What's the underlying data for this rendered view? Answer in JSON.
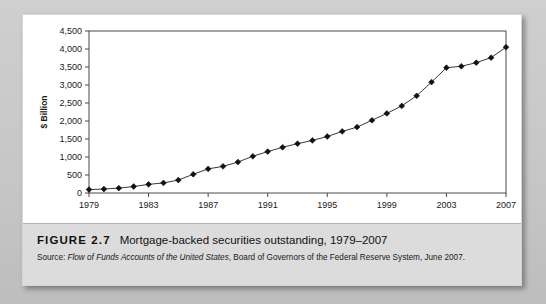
{
  "figure": {
    "number_label": "FIGURE 2.7",
    "title": "Mortgage-backed securities outstanding, 1979–2007",
    "source_prefix": "Source: ",
    "source_italic": "Flow of Funds Accounts of the United States",
    "source_rest": ", Board of Governors of the Federal Reserve System, June 2007."
  },
  "chart_data": {
    "type": "line",
    "title": "Mortgage-backed securities outstanding, 1979–2007",
    "xlabel": "",
    "ylabel": "$ Billion",
    "ylim": [
      0,
      4500
    ],
    "ytick_step": 500,
    "ytick_labels": [
      "0",
      "500",
      "1,000",
      "1,500",
      "2,000",
      "2,500",
      "3,000",
      "3,500",
      "4,000",
      "4,500"
    ],
    "ytick_values": [
      0,
      500,
      1000,
      1500,
      2000,
      2500,
      3000,
      3500,
      4000,
      4500
    ],
    "xlim": [
      1979,
      2007
    ],
    "xtick_labels": [
      "1979",
      "1983",
      "1987",
      "1991",
      "1995",
      "1999",
      "2003",
      "2007"
    ],
    "xtick_values": [
      1979,
      1983,
      1987,
      1991,
      1995,
      1999,
      2003,
      2007
    ],
    "grid": false,
    "legend": false,
    "marker": "diamond",
    "line_color": "#3a3a3a",
    "marker_color": "#111111",
    "x": [
      1979,
      1980,
      1981,
      1982,
      1983,
      1984,
      1985,
      1986,
      1987,
      1988,
      1989,
      1990,
      1991,
      1992,
      1993,
      1994,
      1995,
      1996,
      1997,
      1998,
      1999,
      2000,
      2001,
      2002,
      2003,
      2004,
      2005,
      2006,
      2007
    ],
    "values": [
      95,
      110,
      135,
      180,
      240,
      280,
      360,
      520,
      670,
      740,
      860,
      1020,
      1150,
      1270,
      1370,
      1460,
      1570,
      1710,
      1830,
      2020,
      2210,
      2420,
      2700,
      3080,
      3480,
      3520,
      3620,
      3760,
      4050
    ],
    "series": [
      {
        "name": "Mortgage-backed securities outstanding",
        "values": [
          95,
          110,
          135,
          180,
          240,
          280,
          360,
          520,
          670,
          740,
          860,
          1020,
          1150,
          1270,
          1370,
          1460,
          1570,
          1710,
          1830,
          2020,
          2210,
          2420,
          2700,
          3080,
          3480,
          3520,
          3620,
          3760,
          4050
        ]
      }
    ]
  }
}
